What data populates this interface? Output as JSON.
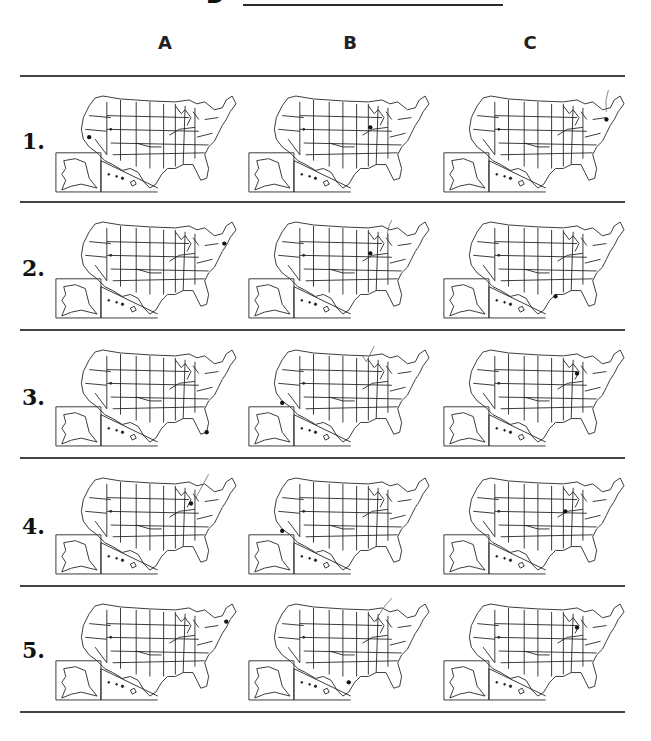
{
  "header": {
    "section_letter": "D",
    "columns": [
      "A",
      "B",
      "C"
    ]
  },
  "rows": [
    {
      "number": "1.",
      "options": [
        {
          "column": "A",
          "marked_location": "California"
        },
        {
          "column": "B",
          "marked_location": "Illinois"
        },
        {
          "column": "C",
          "marked_location": "New York",
          "checked": true
        }
      ]
    },
    {
      "number": "2.",
      "options": [
        {
          "column": "A",
          "marked_location": "New York / Connecticut"
        },
        {
          "column": "B",
          "marked_location": "Illinois",
          "checked": true
        },
        {
          "column": "C",
          "marked_location": "Louisiana"
        }
      ]
    },
    {
      "number": "3.",
      "options": [
        {
          "column": "A",
          "marked_location": "Florida"
        },
        {
          "column": "B",
          "marked_location": "California",
          "checked": true
        },
        {
          "column": "C",
          "marked_location": "Michigan"
        }
      ]
    },
    {
      "number": "4.",
      "options": [
        {
          "column": "A",
          "marked_location": "Ohio / Michigan",
          "checked": true
        },
        {
          "column": "B",
          "marked_location": "California"
        },
        {
          "column": "C",
          "marked_location": "Illinois"
        }
      ]
    },
    {
      "number": "5.",
      "options": [
        {
          "column": "A",
          "marked_location": "Massachusetts"
        },
        {
          "column": "B",
          "marked_location": "Texas",
          "checked": true
        },
        {
          "column": "C",
          "marked_location": "Michigan"
        }
      ]
    }
  ],
  "map_icon": "us-states-outline-map-with-alaska-hawaii-insets"
}
